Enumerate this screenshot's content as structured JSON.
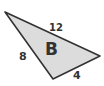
{
  "figure": {
    "shape": "triangle",
    "name_label": "B",
    "side_labels": {
      "top": "12",
      "left": "8",
      "bottom": "4"
    },
    "fill_color": "#dcdcdc",
    "stroke_color": "#333333"
  }
}
